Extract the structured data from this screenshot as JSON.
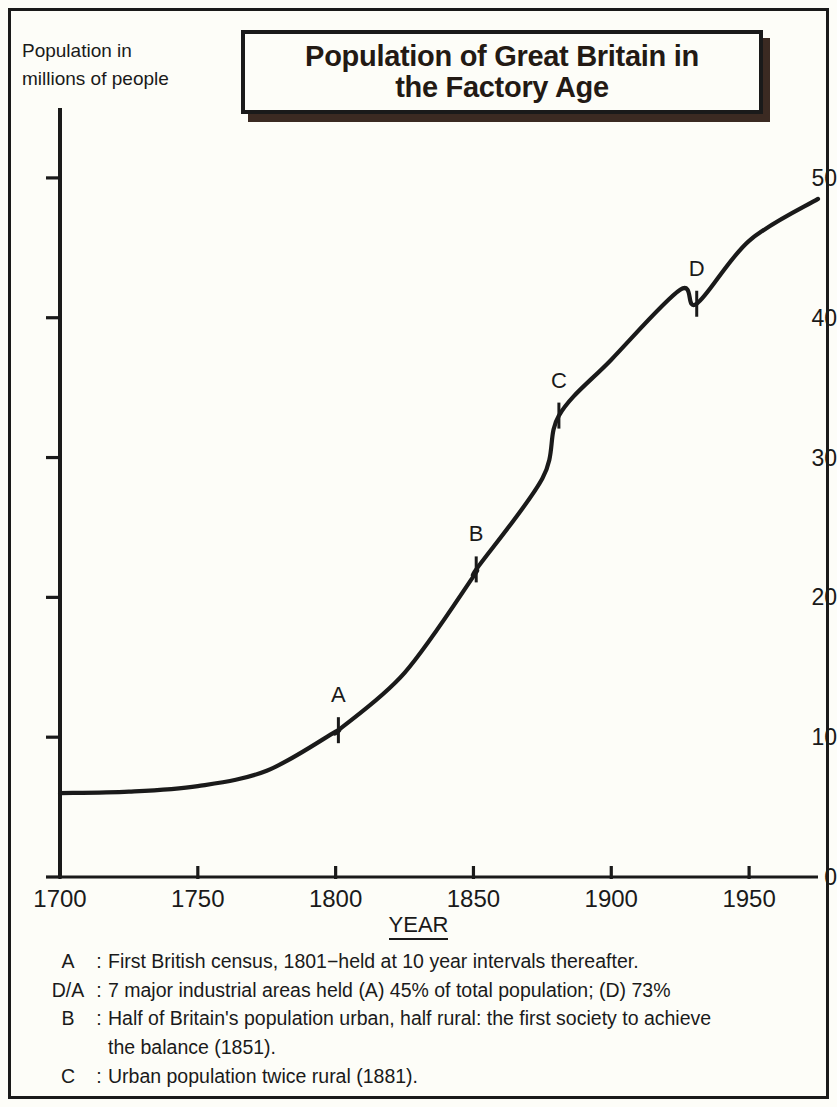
{
  "title": {
    "line1": "Population of Great Britain in",
    "line2": "the  Factory Age"
  },
  "y_caption": {
    "line1": "Population  in",
    "line2": "millions of people"
  },
  "x_axis_title": "YEAR",
  "notes": [
    {
      "key": "A",
      "colon": ":",
      "text": "First  British census, 1801−held at 10 year intervals thereafter."
    },
    {
      "key": "D/A",
      "colon": ":",
      "text": "7 major industrial areas held (A) 45% of total population; (D) 73%"
    },
    {
      "key": "B",
      "colon": ":",
      "text": "Half of Britain's population urban, half rural: the first society to achieve"
    },
    {
      "key": "",
      "colon": "",
      "text": "the balance (1851)."
    },
    {
      "key": "C",
      "colon": ":",
      "text": "Urban population twice rural (1881)."
    }
  ],
  "chart_data": {
    "type": "line",
    "title": "Population of Great Britain in the Factory Age",
    "xlabel": "YEAR",
    "ylabel": "Population in millions of people",
    "xlim": [
      1700,
      1975
    ],
    "ylim": [
      0,
      55
    ],
    "xticks": [
      1700,
      1750,
      1800,
      1850,
      1900,
      1950
    ],
    "yticks": [
      0,
      10,
      20,
      30,
      40,
      50
    ],
    "grid": false,
    "legend": false,
    "x": [
      1700,
      1725,
      1750,
      1775,
      1800,
      1801,
      1825,
      1850,
      1851,
      1875,
      1881,
      1900,
      1925,
      1931,
      1950,
      1975
    ],
    "y": [
      6.0,
      6.1,
      6.5,
      7.6,
      10.4,
      10.5,
      14.6,
      21.5,
      22.0,
      28.5,
      33.0,
      37.0,
      42.0,
      41.0,
      45.5,
      48.5
    ],
    "series": [
      {
        "name": "Population of Great Britain",
        "values": [
          6.0,
          6.1,
          6.5,
          7.6,
          10.4,
          10.5,
          14.6,
          21.5,
          22.0,
          28.5,
          33.0,
          37.0,
          42.0,
          41.0,
          45.5,
          48.5
        ]
      }
    ],
    "annotations": [
      {
        "label": "A",
        "year": 1801,
        "value": 10.5
      },
      {
        "label": "B",
        "year": 1851,
        "value": 22.0
      },
      {
        "label": "C",
        "year": 1881,
        "value": 33.0
      },
      {
        "label": "D",
        "year": 1931,
        "value": 41.0
      }
    ]
  },
  "colors": {
    "ink": "#1a1a1a",
    "paper": "#fdfdf8",
    "title_shadow": "#3b2a22"
  }
}
